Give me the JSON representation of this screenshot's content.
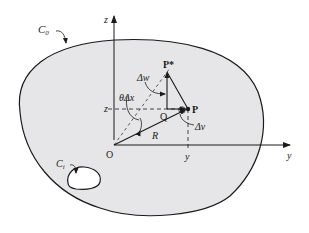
{
  "figure": {
    "type": "cross-section-diagram"
  },
  "labels": {
    "outer_boundary": "C",
    "outer_boundary_sub": "0",
    "inner_boundary": "C",
    "inner_boundary_sub": "i",
    "z_axis": "z",
    "y_axis": "y",
    "origin": "O",
    "point_p": "P",
    "point_p_star": "P*",
    "point_q": "Q",
    "radius": "R",
    "delta_w": "Δw",
    "delta_v": "Δv",
    "theta_delta_x": "θΔx",
    "z_coord": "z",
    "y_coord": "y"
  },
  "colors": {
    "section_fill": "#e6e6e8",
    "stroke": "#1a1a1a",
    "background": "#ffffff"
  }
}
